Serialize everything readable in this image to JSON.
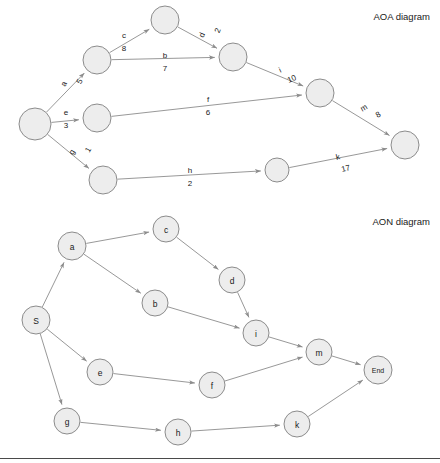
{
  "page": {
    "width": 440,
    "height": 463,
    "background": "#ffffff",
    "node_fill": "#ededed",
    "node_stroke": "#8c8c8c",
    "edge_stroke": "#8c8c8c",
    "text_color": "#1a1a1a"
  },
  "titles": {
    "aoa": "AOA diagram",
    "aon": "AON diagram"
  },
  "chart_data": {
    "type": "diagram",
    "activities": [
      {
        "name": "a",
        "duration": 5
      },
      {
        "name": "b",
        "duration": 7
      },
      {
        "name": "c",
        "duration": 8
      },
      {
        "name": "d",
        "duration": 2
      },
      {
        "name": "e",
        "duration": 3
      },
      {
        "name": "f",
        "duration": 6
      },
      {
        "name": "g",
        "duration": 1
      },
      {
        "name": "h",
        "duration": 2
      },
      {
        "name": "i",
        "duration": 10
      },
      {
        "name": "k",
        "duration": 17
      },
      {
        "name": "m",
        "duration": 8
      }
    ],
    "aoa": {
      "nodes": [
        {
          "id": "n1",
          "cx": 35,
          "cy": 124,
          "r": 16,
          "label": ""
        },
        {
          "id": "n2",
          "cx": 97,
          "cy": 60,
          "r": 14,
          "label": ""
        },
        {
          "id": "n3",
          "cx": 165,
          "cy": 20,
          "r": 14,
          "label": ""
        },
        {
          "id": "n4",
          "cx": 233,
          "cy": 57,
          "r": 14,
          "label": ""
        },
        {
          "id": "n5",
          "cx": 320,
          "cy": 93,
          "r": 14,
          "label": ""
        },
        {
          "id": "n6",
          "cx": 97,
          "cy": 118,
          "r": 14,
          "label": ""
        },
        {
          "id": "n7",
          "cx": 405,
          "cy": 145,
          "r": 14,
          "label": ""
        },
        {
          "id": "n8",
          "cx": 103,
          "cy": 180,
          "r": 14,
          "label": ""
        },
        {
          "id": "n9",
          "cx": 277,
          "cy": 170,
          "r": 12,
          "label": ""
        }
      ],
      "edges": [
        {
          "from": "n1",
          "to": "n2",
          "activity": "a",
          "duration": "5",
          "lx": 64,
          "ly": 84,
          "rot": -65,
          "dx": 9
        },
        {
          "from": "n1",
          "to": "n6",
          "activity": "e",
          "duration": "3",
          "lx": 66,
          "ly": 112,
          "rot": 0,
          "dx": 0
        },
        {
          "from": "n1",
          "to": "n8",
          "activity": "g",
          "duration": "1",
          "lx": 72,
          "ly": 152,
          "rot": -60,
          "dx": 10
        },
        {
          "from": "n2",
          "to": "n3",
          "activity": "c",
          "duration": "8",
          "lx": 124,
          "ly": 35,
          "rot": 0,
          "dx": 0
        },
        {
          "from": "n2",
          "to": "n4",
          "activity": "b",
          "duration": "7",
          "lx": 165,
          "ly": 55,
          "rot": 0,
          "dx": 0
        },
        {
          "from": "n3",
          "to": "n4",
          "activity": "d",
          "duration": "2",
          "lx": 202,
          "ly": 35,
          "rot": -68,
          "dx": 10
        },
        {
          "from": "n4",
          "to": "n5",
          "activity": "i",
          "duration": "10",
          "lx": 280,
          "ly": 70,
          "rot": -24,
          "dx": 7
        },
        {
          "from": "n6",
          "to": "n5",
          "activity": "f",
          "duration": "6",
          "lx": 208,
          "ly": 99,
          "rot": 0,
          "dx": 0
        },
        {
          "from": "n5",
          "to": "n7",
          "activity": "m",
          "duration": "8",
          "lx": 364,
          "ly": 108,
          "rot": -30,
          "dx": 9
        },
        {
          "from": "n8",
          "to": "n9",
          "activity": "h",
          "duration": "2",
          "lx": 190,
          "ly": 170,
          "rot": 0,
          "dx": 0
        },
        {
          "from": "n9",
          "to": "n7",
          "activity": "k",
          "duration": "17",
          "lx": 338,
          "ly": 157,
          "rot": -13,
          "dx": 5
        }
      ]
    },
    "aon": {
      "nodes": [
        {
          "id": "S",
          "cx": 36,
          "cy": 320,
          "r": 14,
          "label": "S"
        },
        {
          "id": "a",
          "cx": 72,
          "cy": 246,
          "r": 14,
          "label": "a"
        },
        {
          "id": "c",
          "cx": 166,
          "cy": 229,
          "r": 13,
          "label": "c"
        },
        {
          "id": "b",
          "cx": 155,
          "cy": 303,
          "r": 13,
          "label": "b"
        },
        {
          "id": "d",
          "cx": 232,
          "cy": 280,
          "r": 13,
          "label": "d"
        },
        {
          "id": "i",
          "cx": 256,
          "cy": 333,
          "r": 13,
          "label": "i"
        },
        {
          "id": "m",
          "cx": 319,
          "cy": 352,
          "r": 13,
          "label": "m"
        },
        {
          "id": "End",
          "cx": 378,
          "cy": 370,
          "r": 14,
          "label": "End"
        },
        {
          "id": "e",
          "cx": 100,
          "cy": 372,
          "r": 13,
          "label": "e"
        },
        {
          "id": "f",
          "cx": 212,
          "cy": 385,
          "r": 13,
          "label": "f"
        },
        {
          "id": "g",
          "cx": 67,
          "cy": 421,
          "r": 13,
          "label": "g"
        },
        {
          "id": "h",
          "cx": 178,
          "cy": 432,
          "r": 13,
          "label": "h"
        },
        {
          "id": "k",
          "cx": 297,
          "cy": 424,
          "r": 13,
          "label": "k"
        }
      ],
      "edges": [
        {
          "from": "S",
          "to": "a"
        },
        {
          "from": "S",
          "to": "e"
        },
        {
          "from": "S",
          "to": "g"
        },
        {
          "from": "a",
          "to": "c"
        },
        {
          "from": "a",
          "to": "b"
        },
        {
          "from": "c",
          "to": "d"
        },
        {
          "from": "b",
          "to": "i"
        },
        {
          "from": "d",
          "to": "i"
        },
        {
          "from": "i",
          "to": "m"
        },
        {
          "from": "e",
          "to": "f"
        },
        {
          "from": "f",
          "to": "m"
        },
        {
          "from": "m",
          "to": "End"
        },
        {
          "from": "g",
          "to": "h"
        },
        {
          "from": "h",
          "to": "k"
        },
        {
          "from": "k",
          "to": "End"
        }
      ]
    }
  }
}
